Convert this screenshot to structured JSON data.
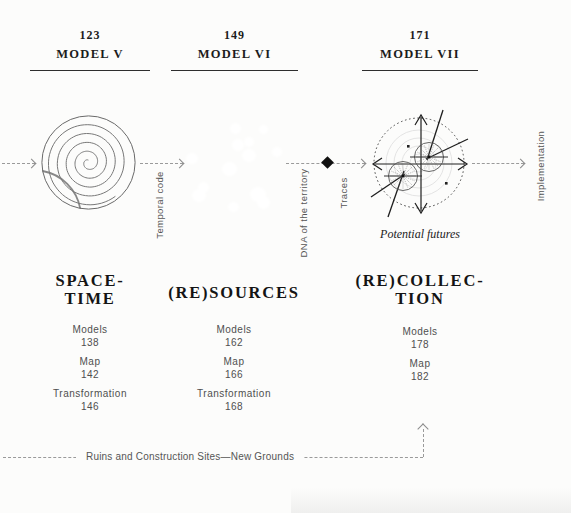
{
  "models": [
    {
      "page": "123",
      "label": "MODEL V"
    },
    {
      "page": "149",
      "label": "MODEL VI"
    },
    {
      "page": "171",
      "label": "MODEL VII"
    }
  ],
  "sections": [
    {
      "title_lines": [
        "SPACE-",
        "TIME"
      ],
      "items": [
        {
          "label": "Models",
          "page": "138"
        },
        {
          "label": "Map",
          "page": "142"
        },
        {
          "label": "Transformation",
          "page": "146"
        }
      ]
    },
    {
      "title_lines": [
        "(RE)SOURCES"
      ],
      "items": [
        {
          "label": "Models",
          "page": "162"
        },
        {
          "label": "Map",
          "page": "166"
        },
        {
          "label": "Transformation",
          "page": "168"
        }
      ]
    },
    {
      "title_lines": [
        "(RE)COLLEC-",
        "TION"
      ],
      "items": [
        {
          "label": "Models",
          "page": "178"
        },
        {
          "label": "Map",
          "page": "182"
        }
      ]
    }
  ],
  "flow_labels": {
    "temporal_code": "Temporal code",
    "dna_territory": "DNA of the territory",
    "traces": "Traces",
    "implementation": "Implementation",
    "potential_futures": "Potential futures"
  },
  "footer": {
    "label": "Ruins and Construction Sites—New Grounds"
  },
  "colors": {
    "text_dark": "#1c1c1c",
    "text_gray": "#4f4f4f",
    "dash_gray": "#9a9a9a",
    "diamond_black": "#101010"
  }
}
